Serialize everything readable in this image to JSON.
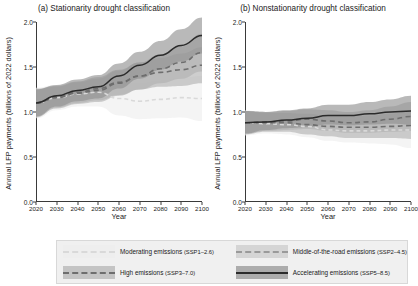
{
  "figure": {
    "xlabel": "Year",
    "ylabel": "Annual LFP payments (billions of 2022 dollars)"
  },
  "panels": [
    {
      "title": "(a) Stationarity drought classification"
    },
    {
      "title": "(b) Nonstationarity drought classification"
    }
  ],
  "legend": {
    "items": [
      {
        "label": "Moderating emissions",
        "scenario": "(SSP1–2.6)",
        "style": "dotted",
        "color": "#d9d9d9",
        "band": "#ededed"
      },
      {
        "label": "Middle-of-the-road emissions",
        "scenario": "(SSP2–4.5)",
        "style": "dashed",
        "color": "#9a9a9a",
        "band": "#c9c9c9"
      },
      {
        "label": "High emissions",
        "scenario": "(SSP3–7.0)",
        "style": "dashed",
        "color": "#6e6e6e",
        "band": "#b0b0b0"
      },
      {
        "label": "Accelerating emissions",
        "scenario": "(SSP5–8.5)",
        "style": "solid",
        "color": "#2b2b2b",
        "band": "#8e8e8e"
      }
    ]
  },
  "chart_data": {
    "type": "line",
    "xlabel": "Year",
    "ylabel": "Annual LFP payments (billions of 2022 dollars)",
    "xlim": [
      2020,
      2100
    ],
    "ylim": [
      0.0,
      2.0
    ],
    "xticks": [
      2020,
      2030,
      2040,
      2050,
      2060,
      2070,
      2080,
      2090,
      2100
    ],
    "yticks": [
      "0.0",
      "0.5",
      "1.0",
      "1.5",
      "2.0"
    ],
    "grid": false,
    "legend_position": "bottom",
    "panels": [
      {
        "key": "a",
        "title": "(a) Stationarity drought classification",
        "x": [
          2020,
          2030,
          2040,
          2050,
          2060,
          2070,
          2080,
          2090,
          2100
        ],
        "series": [
          {
            "name": "Moderating emissions (SSP1–2.6)",
            "style": "dotted",
            "values": [
              1.1,
              1.16,
              1.2,
              1.22,
              1.15,
              1.12,
              1.14,
              1.16,
              1.15
            ],
            "lower": [
              0.93,
              1.02,
              1.06,
              1.06,
              0.96,
              0.92,
              0.93,
              0.94,
              0.9
            ],
            "upper": [
              1.27,
              1.3,
              1.34,
              1.38,
              1.34,
              1.32,
              1.35,
              1.38,
              1.4
            ]
          },
          {
            "name": "Middle-of-the-road emissions (SSP2–4.5)",
            "style": "dashed",
            "values": [
              1.1,
              1.16,
              1.21,
              1.24,
              1.32,
              1.4,
              1.48,
              1.55,
              1.66
            ],
            "lower": [
              0.95,
              1.04,
              1.09,
              1.11,
              1.18,
              1.25,
              1.32,
              1.37,
              1.45
            ],
            "upper": [
              1.25,
              1.28,
              1.33,
              1.37,
              1.46,
              1.55,
              1.64,
              1.73,
              1.87
            ]
          },
          {
            "name": "High emissions (SSP3–7.0)",
            "style": "dashed",
            "values": [
              1.1,
              1.17,
              1.22,
              1.26,
              1.33,
              1.4,
              1.44,
              1.47,
              1.52
            ],
            "lower": [
              0.94,
              1.05,
              1.1,
              1.13,
              1.19,
              1.25,
              1.28,
              1.29,
              1.32
            ],
            "upper": [
              1.26,
              1.29,
              1.34,
              1.39,
              1.47,
              1.55,
              1.6,
              1.65,
              1.72
            ]
          },
          {
            "name": "Accelerating emissions (SSP5–8.5)",
            "style": "solid",
            "values": [
              1.1,
              1.18,
              1.24,
              1.28,
              1.4,
              1.52,
              1.63,
              1.74,
              1.85
            ],
            "lower": [
              0.95,
              1.06,
              1.12,
              1.15,
              1.26,
              1.37,
              1.47,
              1.56,
              1.65
            ],
            "upper": [
              1.25,
              1.3,
              1.36,
              1.41,
              1.54,
              1.67,
              1.79,
              1.92,
              2.05
            ]
          }
        ]
      },
      {
        "key": "b",
        "title": "(b) Nonstationarity drought classification",
        "x": [
          2020,
          2030,
          2040,
          2050,
          2060,
          2070,
          2080,
          2090,
          2100
        ],
        "series": [
          {
            "name": "Moderating emissions (SSP1–2.6)",
            "style": "dotted",
            "values": [
              0.88,
              0.87,
              0.86,
              0.84,
              0.8,
              0.79,
              0.79,
              0.8,
              0.8
            ],
            "lower": [
              0.74,
              0.76,
              0.75,
              0.72,
              0.68,
              0.66,
              0.65,
              0.64,
              0.6
            ],
            "upper": [
              1.02,
              0.98,
              0.97,
              0.96,
              0.93,
              0.92,
              0.93,
              0.95,
              0.98
            ]
          },
          {
            "name": "Middle-of-the-road emissions (SSP2–4.5)",
            "style": "dashed",
            "values": [
              0.88,
              0.88,
              0.88,
              0.86,
              0.84,
              0.83,
              0.83,
              0.84,
              0.85
            ],
            "lower": [
              0.75,
              0.78,
              0.78,
              0.75,
              0.73,
              0.71,
              0.71,
              0.71,
              0.7
            ],
            "upper": [
              1.01,
              0.99,
              0.99,
              0.98,
              0.96,
              0.95,
              0.96,
              0.98,
              1.01
            ]
          },
          {
            "name": "High emissions (SSP3–7.0)",
            "style": "dashed",
            "values": [
              0.88,
              0.89,
              0.9,
              0.92,
              0.9,
              0.88,
              0.89,
              0.92,
              0.95
            ],
            "lower": [
              0.76,
              0.79,
              0.8,
              0.81,
              0.79,
              0.77,
              0.77,
              0.78,
              0.79
            ],
            "upper": [
              1.01,
              1.0,
              1.01,
              1.03,
              1.02,
              1.0,
              1.02,
              1.06,
              1.11
            ]
          },
          {
            "name": "Accelerating emissions (SSP5–8.5)",
            "style": "solid",
            "values": [
              0.88,
              0.89,
              0.91,
              0.93,
              0.96,
              0.96,
              0.98,
              1.0,
              1.01
            ],
            "lower": [
              0.76,
              0.8,
              0.82,
              0.83,
              0.86,
              0.85,
              0.86,
              0.87,
              0.86
            ],
            "upper": [
              1.01,
              1.0,
              1.02,
              1.04,
              1.08,
              1.08,
              1.11,
              1.14,
              1.18
            ]
          }
        ]
      }
    ]
  }
}
